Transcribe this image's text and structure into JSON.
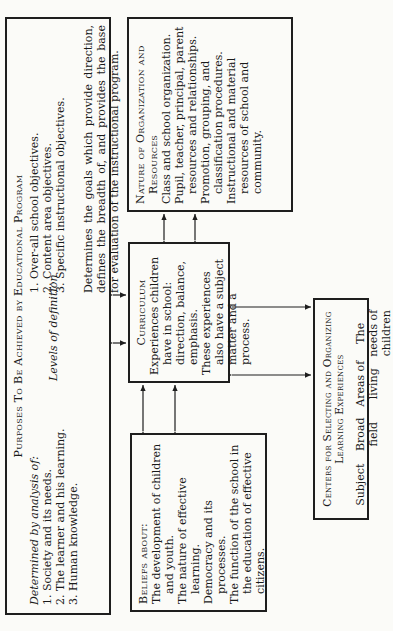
{
  "purposes": {
    "title": "Purposes To Be Achieved by Educational Program",
    "determined_label": "Determined by analysis of:",
    "determined_items": [
      "1. Society and its needs.",
      "2. The learner and his learning.",
      "3. Human knowledge."
    ],
    "levels_label": "Levels of definition",
    "levels_items": [
      "1. Over-all school objectives.",
      "2. Content area objectives.",
      "3. Specific instructional objectives."
    ],
    "goals_text": "Determines the goals which provide direction, defines the breadth of, and provides the base for evaluation of the instructional program."
  },
  "nature": {
    "title": "Nature of Organization and Resources",
    "items": [
      "Class and school organization.",
      "Pupil, teacher, principal, parent resources and relationships.",
      "Promotion, grouping, and classification procedures.",
      "Instructional and material resources of school and community."
    ]
  },
  "curriculum": {
    "title": "Curriculum",
    "items": [
      "Experiences children have in school: direction, balance, emphasis.",
      "These experiences also have a subject matter and a process."
    ]
  },
  "beliefs": {
    "title": "Beliefs about:",
    "items": [
      "The development of children and youth.",
      "The nature of effective learning.",
      "Democracy and its processes.",
      "The function of the school in the education of effective citizens."
    ]
  },
  "centers": {
    "title": "Centers for Selecting and Organizing Learning Experiences",
    "columns": [
      "Subject",
      "Broad field",
      "Areas of living",
      "The needs of children"
    ]
  },
  "colors": {
    "line": "#1e1e1e",
    "paper": "#fbfbf8",
    "text": "#1a1a1a"
  }
}
